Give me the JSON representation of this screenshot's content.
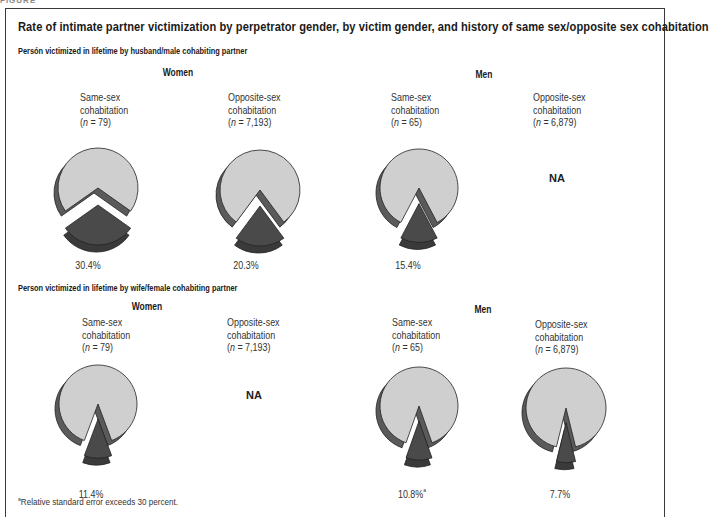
{
  "figure_label": "FIGURE",
  "title": "Rate of intimate partner victimization by perpetrator gender, by victim gender, and history of same sex/opposite sex cohabitation",
  "footnote_marker": "a",
  "footnote": "Relative standard error exceeds 30 percent.",
  "colors": {
    "background_slice": "#cfcfcf",
    "highlight_slice": "#4a4a4a",
    "shadow": "#5a5a5a",
    "outline": "#222222"
  },
  "sections": [
    {
      "heading": "Persón victimized in lifetime by husband/male cohabiting  partner",
      "groups": [
        {
          "label": "Women",
          "charts": [
            {
              "line1": "Same-sex",
              "line2": "cohabitation",
              "n_prefix": "(",
              "n_var": "n",
              "n_value": " = 79)",
              "value_label": "30.4%",
              "footnote": ""
            },
            {
              "line1": "Opposite-sex",
              "line2": "cohabitation",
              "n_prefix": "(",
              "n_var": "n",
              "n_value": " = 7,193)",
              "value_label": "20.3%",
              "footnote": ""
            }
          ]
        },
        {
          "label": "Men",
          "charts": [
            {
              "line1": "Same-sex",
              "line2": "cohabitation",
              "n_prefix": "(",
              "n_var": "n",
              "n_value": " = 65)",
              "value_label": "15.4%",
              "footnote": ""
            },
            {
              "line1": "Opposite-sex",
              "line2": "cohabitation",
              "n_prefix": "(",
              "n_var": "n",
              "n_value": " = 6,879)",
              "value_label": "NA",
              "footnote": ""
            }
          ]
        }
      ]
    },
    {
      "heading": "Person victimized in lifetime by wife/female cohabiting  partner",
      "groups": [
        {
          "label": "Women",
          "charts": [
            {
              "line1": "Same-sex",
              "line2": "cohabitation",
              "n_prefix": "(",
              "n_var": "n",
              "n_value": " = 79)",
              "value_label": "11.4%",
              "footnote": ""
            },
            {
              "line1": "Opposite-sex",
              "line2": "cohabitation",
              "n_prefix": "(",
              "n_var": "n",
              "n_value": " = 7,193)",
              "value_label": "NA",
              "footnote": ""
            }
          ]
        },
        {
          "label": "Men",
          "charts": [
            {
              "line1": "Same-sex",
              "line2": "cohabitation",
              "n_prefix": "(",
              "n_var": "n",
              "n_value": " = 65)",
              "value_label": "10.8%",
              "footnote": "a"
            },
            {
              "line1": "Opposite-sex",
              "line2": "cohabitation",
              "n_prefix": "(",
              "n_var": "n",
              "n_value": " = 6,879)",
              "value_label": "7.7%",
              "footnote": ""
            }
          ]
        }
      ]
    }
  ],
  "chart_data": [
    {
      "type": "pie",
      "title": "Husband/male partner — Women, Same-sex cohabitation (n = 79)",
      "categories": [
        "Victimized",
        "Not victimized"
      ],
      "values": [
        30.4,
        69.6
      ]
    },
    {
      "type": "pie",
      "title": "Husband/male partner — Women, Opposite-sex cohabitation (n = 7,193)",
      "categories": [
        "Victimized",
        "Not victimized"
      ],
      "values": [
        20.3,
        79.7
      ]
    },
    {
      "type": "pie",
      "title": "Husband/male partner — Men, Same-sex cohabitation (n = 65)",
      "categories": [
        "Victimized",
        "Not victimized"
      ],
      "values": [
        15.4,
        84.6
      ]
    },
    {
      "type": "pie",
      "title": "Husband/male partner — Men, Opposite-sex cohabitation (n = 6,879)",
      "categories": [
        "Victimized",
        "Not victimized"
      ],
      "values": null,
      "annotation": "NA"
    },
    {
      "type": "pie",
      "title": "Wife/female partner — Women, Same-sex cohabitation (n = 79)",
      "categories": [
        "Victimized",
        "Not victimized"
      ],
      "values": [
        11.4,
        88.6
      ]
    },
    {
      "type": "pie",
      "title": "Wife/female partner — Women, Opposite-sex cohabitation (n = 7,193)",
      "categories": [
        "Victimized",
        "Not victimized"
      ],
      "values": null,
      "annotation": "NA"
    },
    {
      "type": "pie",
      "title": "Wife/female partner — Men, Same-sex cohabitation (n = 65)",
      "categories": [
        "Victimized",
        "Not victimized"
      ],
      "values": [
        10.8,
        89.2
      ],
      "annotation": "Relative standard error exceeds 30 percent"
    },
    {
      "type": "pie",
      "title": "Wife/female partner — Men, Opposite-sex cohabitation (n = 6,879)",
      "categories": [
        "Victimized",
        "Not victimized"
      ],
      "values": [
        7.7,
        92.3
      ]
    }
  ]
}
